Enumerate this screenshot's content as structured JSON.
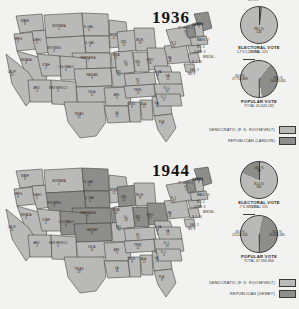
{
  "document": {
    "type": "historical-election-map-figure",
    "panels": [
      "1936",
      "1944"
    ]
  },
  "panel_1936": {
    "year": "1936",
    "legend": {
      "democratic": "DEMOCRATIC (F. D. ROOSEVELT)",
      "republican": "REPUBLICAN (LANDON)"
    },
    "electoral": {
      "caption": "ELECTORAL VOTE",
      "total": "TOTAL 531",
      "winner_pct": "98.5 %",
      "winner_votes": "523",
      "loser_pct": "1.5 %",
      "loser_votes": "8"
    },
    "popular": {
      "caption": "POPULAR VOTE",
      "total": "TOTAL 45,643,182",
      "winner_pct": "60.8 %",
      "winner_votes": "27,752,869",
      "loser_pct": "36.5 %",
      "loser_votes": "16,674,665",
      "misc_label": "MISCEL.",
      "misc_pct": "2.7 %",
      "misc_votes": "1,200,900"
    },
    "states": [
      {
        "ab": "WASH",
        "ev": "8",
        "x": 21,
        "y": 11,
        "rep": false
      },
      {
        "ab": "OREG",
        "ev": "5",
        "x": 14,
        "y": 29,
        "rep": false
      },
      {
        "ab": "IDAHO",
        "ev": "4",
        "x": 33,
        "y": 30,
        "rep": false
      },
      {
        "ab": "MONTANA",
        "ev": "4",
        "x": 55,
        "y": 16,
        "rep": false
      },
      {
        "ab": "N. DAK.",
        "ev": "4",
        "x": 85,
        "y": 17,
        "rep": false
      },
      {
        "ab": "S. DAK.",
        "ev": "4",
        "x": 86,
        "y": 33,
        "rep": false
      },
      {
        "ab": "MINN.",
        "ev": "11",
        "x": 110,
        "y": 25,
        "rep": false
      },
      {
        "ab": "WYOMING",
        "ev": "3",
        "x": 50,
        "y": 38,
        "rep": false
      },
      {
        "ab": "NEBRASKA",
        "ev": "7",
        "x": 84,
        "y": 48,
        "rep": false
      },
      {
        "ab": "IOWA",
        "ev": "11",
        "x": 112,
        "y": 45,
        "rep": false
      },
      {
        "ab": "NEVADA",
        "ev": "3",
        "x": 22,
        "y": 50,
        "rep": false
      },
      {
        "ab": "UTAH",
        "ev": "4",
        "x": 42,
        "y": 55,
        "rep": false
      },
      {
        "ab": "COLORADO",
        "ev": "6",
        "x": 62,
        "y": 57,
        "rep": false
      },
      {
        "ab": "KANSAS",
        "ev": "9",
        "x": 88,
        "y": 65,
        "rep": false
      },
      {
        "ab": "MO.",
        "ev": "15",
        "x": 115,
        "y": 62,
        "rep": false
      },
      {
        "ab": "CALIF.",
        "ev": "22",
        "x": 8,
        "y": 62,
        "rep": false
      },
      {
        "ab": "ARIZ.",
        "ev": "3",
        "x": 33,
        "y": 78,
        "rep": false
      },
      {
        "ab": "NEW MEXICO",
        "ev": "3",
        "x": 54,
        "y": 78,
        "rep": false
      },
      {
        "ab": "OKLA.",
        "ev": "11",
        "x": 88,
        "y": 82,
        "rep": false
      },
      {
        "ab": "TEXAS",
        "ev": "23",
        "x": 75,
        "y": 104,
        "rep": false
      },
      {
        "ab": "ARK.",
        "ev": "9",
        "x": 113,
        "y": 85,
        "rep": false
      },
      {
        "ab": "LA.",
        "ev": "10",
        "x": 113,
        "y": 103,
        "rep": false
      },
      {
        "ab": "MISS.",
        "ev": "9",
        "x": 128,
        "y": 94,
        "rep": false
      },
      {
        "ab": "ALA.",
        "ev": "11",
        "x": 140,
        "y": 94,
        "rep": false
      },
      {
        "ab": "GA.",
        "ev": "12",
        "x": 153,
        "y": 93,
        "rep": false
      },
      {
        "ab": "FLA.",
        "ev": "7",
        "x": 158,
        "y": 112,
        "rep": false
      },
      {
        "ab": "TENN.",
        "ev": "11",
        "x": 134,
        "y": 80,
        "rep": false
      },
      {
        "ab": "KY.",
        "ev": "11",
        "x": 134,
        "y": 70,
        "rep": false
      },
      {
        "ab": "ILL.",
        "ev": "29",
        "x": 122,
        "y": 52,
        "rep": false
      },
      {
        "ab": "WIS.",
        "ev": "12",
        "x": 120,
        "y": 32,
        "rep": false
      },
      {
        "ab": "MICH.",
        "ev": "19",
        "x": 136,
        "y": 30,
        "rep": false
      },
      {
        "ab": "IND.",
        "ev": "14",
        "x": 134,
        "y": 52,
        "rep": false
      },
      {
        "ab": "OHIO",
        "ev": "26",
        "x": 146,
        "y": 50,
        "rep": false
      },
      {
        "ab": "W. VA.",
        "ev": "8",
        "x": 154,
        "y": 62,
        "rep": false
      },
      {
        "ab": "VA.",
        "ev": "11",
        "x": 164,
        "y": 66,
        "rep": false
      },
      {
        "ab": "N. C.",
        "ev": "13",
        "x": 163,
        "y": 78,
        "rep": false
      },
      {
        "ab": "S. C.",
        "ev": "8",
        "x": 160,
        "y": 87,
        "rep": false
      },
      {
        "ab": "PA.",
        "ev": "36",
        "x": 166,
        "y": 48,
        "rep": false
      },
      {
        "ab": "N. Y.",
        "ev": "47",
        "x": 170,
        "y": 33,
        "rep": false
      },
      {
        "ab": "MAINE",
        "ev": "5",
        "x": 195,
        "y": 14,
        "rep": true
      },
      {
        "ab": "VT.",
        "ev": "3",
        "x": 182,
        "y": 22,
        "rep": true
      }
    ],
    "small_labels": [
      {
        "t": "MAINE 5",
        "x": 188,
        "y": 15
      },
      {
        "t": "VT. 3",
        "x": 174,
        "y": 18
      },
      {
        "t": "N. H. 4",
        "x": 180,
        "y": 18
      },
      {
        "t": "MASS. 17",
        "x": 193,
        "y": 30
      },
      {
        "t": "R. I. 4",
        "x": 193,
        "y": 37
      },
      {
        "t": "CONN. 8",
        "x": 190,
        "y": 42
      },
      {
        "t": "N. J. 16",
        "x": 188,
        "y": 52
      },
      {
        "t": "DEL. 3",
        "x": 186,
        "y": 60
      },
      {
        "t": "MD. 8",
        "x": 184,
        "y": 64
      }
    ]
  },
  "panel_1944": {
    "year": "1944",
    "legend": {
      "democratic": "DEMOCRATIC (F. D. ROOSEVELT)",
      "republican": "REPUBLICAN (DEWEY)"
    },
    "electoral": {
      "caption": "ELECTORAL VOTE",
      "total": "TOTAL 531",
      "winner_pct": "81.4 %",
      "winner_votes": "432",
      "loser_pct": "18.6 %",
      "loser_votes": "99"
    },
    "popular": {
      "caption": "POPULAR VOTE",
      "total": "TOTAL 47,966,866",
      "winner_pct": "53.4 %",
      "winner_votes": "25,606,585",
      "loser_pct": "45.9 %",
      "loser_votes": "22,014,745",
      "misc_label": "MISCEL.",
      "misc_pct": ".7 %",
      "misc_votes": "345,536"
    },
    "states": [
      {
        "ab": "WASH",
        "ev": "8",
        "x": 21,
        "y": 11,
        "rep": false
      },
      {
        "ab": "OREG",
        "ev": "6",
        "x": 14,
        "y": 29,
        "rep": false
      },
      {
        "ab": "IDAHO",
        "ev": "4",
        "x": 33,
        "y": 30,
        "rep": false
      },
      {
        "ab": "MONTANA",
        "ev": "4",
        "x": 55,
        "y": 16,
        "rep": false
      },
      {
        "ab": "N. DAK.",
        "ev": "4",
        "x": 85,
        "y": 17,
        "rep": true
      },
      {
        "ab": "S. DAK.",
        "ev": "4",
        "x": 86,
        "y": 33,
        "rep": true
      },
      {
        "ab": "MINN.",
        "ev": "11",
        "x": 110,
        "y": 25,
        "rep": false
      },
      {
        "ab": "WYOMING",
        "ev": "3",
        "x": 50,
        "y": 38,
        "rep": true
      },
      {
        "ab": "NEBRASKA",
        "ev": "6",
        "x": 84,
        "y": 48,
        "rep": true
      },
      {
        "ab": "IOWA",
        "ev": "10",
        "x": 112,
        "y": 45,
        "rep": true
      },
      {
        "ab": "NEVADA",
        "ev": "3",
        "x": 22,
        "y": 50,
        "rep": false
      },
      {
        "ab": "UTAH",
        "ev": "4",
        "x": 42,
        "y": 55,
        "rep": false
      },
      {
        "ab": "COLORADO",
        "ev": "6",
        "x": 62,
        "y": 57,
        "rep": true
      },
      {
        "ab": "KANSAS",
        "ev": "8",
        "x": 88,
        "y": 65,
        "rep": true
      },
      {
        "ab": "MO.",
        "ev": "15",
        "x": 115,
        "y": 62,
        "rep": false
      },
      {
        "ab": "CALIF.",
        "ev": "25",
        "x": 8,
        "y": 62,
        "rep": false
      },
      {
        "ab": "ARIZ.",
        "ev": "4",
        "x": 33,
        "y": 78,
        "rep": false
      },
      {
        "ab": "NEW MEXICO",
        "ev": "4",
        "x": 54,
        "y": 78,
        "rep": false
      },
      {
        "ab": "OKLA.",
        "ev": "10",
        "x": 88,
        "y": 82,
        "rep": false
      },
      {
        "ab": "TEXAS",
        "ev": "23",
        "x": 75,
        "y": 104,
        "rep": false
      },
      {
        "ab": "ARK.",
        "ev": "9",
        "x": 113,
        "y": 85,
        "rep": false
      },
      {
        "ab": "LA.",
        "ev": "10",
        "x": 113,
        "y": 103,
        "rep": false
      },
      {
        "ab": "MISS.",
        "ev": "9",
        "x": 128,
        "y": 94,
        "rep": false
      },
      {
        "ab": "ALA.",
        "ev": "11",
        "x": 140,
        "y": 94,
        "rep": false
      },
      {
        "ab": "GA.",
        "ev": "12",
        "x": 153,
        "y": 93,
        "rep": false
      },
      {
        "ab": "FLA.",
        "ev": "8",
        "x": 158,
        "y": 112,
        "rep": false
      },
      {
        "ab": "TENN.",
        "ev": "12",
        "x": 134,
        "y": 80,
        "rep": false
      },
      {
        "ab": "KY.",
        "ev": "11",
        "x": 134,
        "y": 70,
        "rep": false
      },
      {
        "ab": "ILL.",
        "ev": "28",
        "x": 122,
        "y": 52,
        "rep": false
      },
      {
        "ab": "WIS.",
        "ev": "12",
        "x": 120,
        "y": 32,
        "rep": true
      },
      {
        "ab": "MICH.",
        "ev": "19",
        "x": 136,
        "y": 30,
        "rep": false
      },
      {
        "ab": "IND.",
        "ev": "13",
        "x": 134,
        "y": 52,
        "rep": true
      },
      {
        "ab": "OHIO",
        "ev": "25",
        "x": 146,
        "y": 50,
        "rep": true
      },
      {
        "ab": "W. VA.",
        "ev": "8",
        "x": 154,
        "y": 62,
        "rep": false
      },
      {
        "ab": "VA.",
        "ev": "11",
        "x": 164,
        "y": 66,
        "rep": false
      },
      {
        "ab": "N. C.",
        "ev": "14",
        "x": 163,
        "y": 78,
        "rep": false
      },
      {
        "ab": "S. C.",
        "ev": "8",
        "x": 160,
        "y": 87,
        "rep": false
      },
      {
        "ab": "PA.",
        "ev": "35",
        "x": 166,
        "y": 48,
        "rep": false
      },
      {
        "ab": "N. Y.",
        "ev": "47",
        "x": 170,
        "y": 33,
        "rep": false
      },
      {
        "ab": "MAINE",
        "ev": "5",
        "x": 195,
        "y": 14,
        "rep": true
      },
      {
        "ab": "VT.",
        "ev": "3",
        "x": 182,
        "y": 22,
        "rep": true
      }
    ],
    "small_labels": [
      {
        "t": "MAINE 5",
        "x": 188,
        "y": 15
      },
      {
        "t": "VT. 3",
        "x": 174,
        "y": 18
      },
      {
        "t": "N. H. 4",
        "x": 180,
        "y": 18
      },
      {
        "t": "MASS. 16",
        "x": 193,
        "y": 30
      },
      {
        "t": "R. I. 4",
        "x": 193,
        "y": 37
      },
      {
        "t": "CONN. 8",
        "x": 190,
        "y": 42
      },
      {
        "t": "N. J. 16",
        "x": 188,
        "y": 52
      },
      {
        "t": "DEL. 3",
        "x": 186,
        "y": 60
      },
      {
        "t": "MD. 8",
        "x": 184,
        "y": 64
      }
    ]
  },
  "colors": {
    "democratic_fill": "#b9b9b7",
    "republican_fill": "#8d8d8a",
    "outline": "#3b3b39",
    "background": "#f2f2f0"
  }
}
